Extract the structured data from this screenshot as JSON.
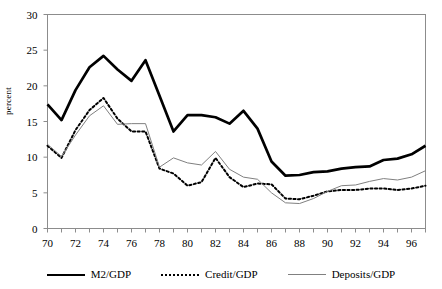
{
  "chart_data": {
    "type": "line",
    "title": "",
    "xlabel": "",
    "ylabel": "percent",
    "ylim": [
      0,
      30
    ],
    "xlim": [
      1970,
      1997
    ],
    "grid": false,
    "legend_position": "bottom",
    "ytick_labels": [
      "30",
      "25",
      "20",
      "15",
      "10",
      "5",
      "0"
    ],
    "ytick_values": [
      30,
      25,
      20,
      15,
      10,
      5,
      0
    ],
    "xtick_labels": [
      "70",
      "72",
      "74",
      "76",
      "78",
      "80",
      "82",
      "84",
      "86",
      "88",
      "90",
      "92",
      "94",
      "96"
    ],
    "xtick_values": [
      1970,
      1972,
      1974,
      1976,
      1978,
      1980,
      1982,
      1984,
      1986,
      1988,
      1990,
      1992,
      1994,
      1996
    ],
    "x": [
      1970,
      1971,
      1972,
      1973,
      1974,
      1975,
      1976,
      1977,
      1978,
      1979,
      1980,
      1981,
      1982,
      1983,
      1984,
      1985,
      1986,
      1987,
      1988,
      1989,
      1990,
      1991,
      1992,
      1993,
      1994,
      1995,
      1996,
      1997
    ],
    "series": [
      {
        "name": "M2/GDP",
        "style": "solid-thick",
        "color": "#000000",
        "values": [
          17.4,
          15.2,
          19.4,
          22.6,
          24.2,
          22.3,
          20.7,
          23.6,
          18.6,
          13.6,
          15.9,
          15.9,
          15.6,
          14.7,
          16.5,
          14.0,
          9.4,
          7.4,
          7.5,
          7.9,
          8.0,
          8.4,
          8.6,
          8.7,
          9.6,
          9.8,
          10.4,
          11.6
        ]
      },
      {
        "name": "Credit/GDP",
        "style": "dotted",
        "color": "#000000",
        "values": [
          11.6,
          9.9,
          13.8,
          16.6,
          18.3,
          15.4,
          13.6,
          13.6,
          8.4,
          7.7,
          6.0,
          6.5,
          9.9,
          7.2,
          5.8,
          6.3,
          6.2,
          4.2,
          4.1,
          4.6,
          5.2,
          5.4,
          5.4,
          5.6,
          5.6,
          5.4,
          5.6,
          6.0
        ]
      },
      {
        "name": "Deposits/GDP",
        "style": "solid-thin",
        "color": "#808080",
        "values": [
          11.8,
          10.1,
          13.1,
          15.8,
          17.2,
          14.6,
          14.7,
          14.7,
          8.6,
          9.9,
          9.2,
          8.9,
          10.8,
          8.3,
          7.2,
          6.9,
          5.0,
          3.6,
          3.5,
          4.2,
          5.2,
          6.0,
          6.1,
          6.6,
          7.0,
          6.8,
          7.2,
          8.1
        ]
      }
    ]
  }
}
